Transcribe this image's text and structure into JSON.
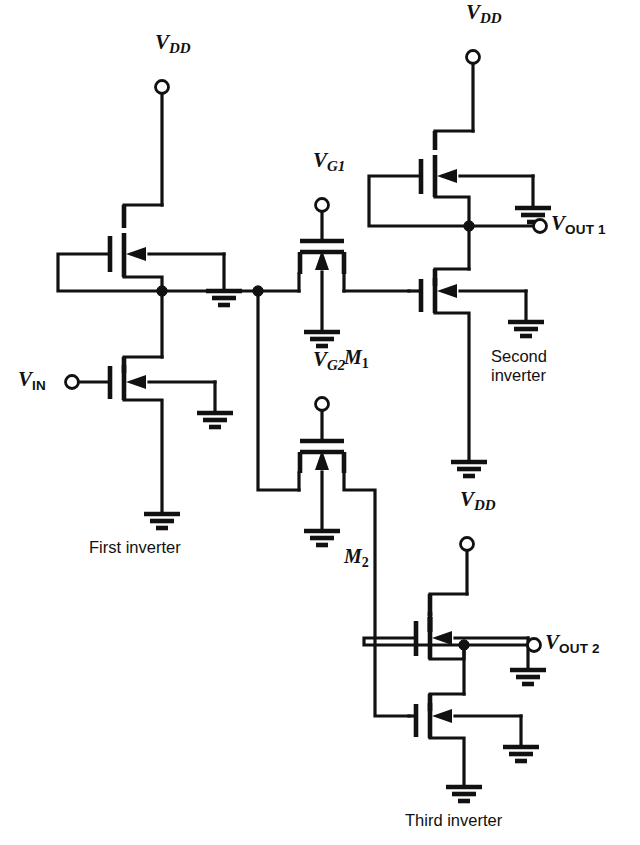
{
  "figure": {
    "type": "circuit-schematic",
    "line_color": "#111111",
    "background_color": "#ffffff"
  },
  "labels": {
    "vdd_first": {
      "base": "V",
      "sub": "DD"
    },
    "vdd_second": {
      "base": "V",
      "sub": "DD"
    },
    "vdd_third": {
      "base": "V",
      "sub": "DD"
    },
    "vin": {
      "base": "V",
      "sub": "IN"
    },
    "vout1": {
      "base": "V",
      "sub": "OUT 1"
    },
    "vout2": {
      "base": "V",
      "sub": "OUT 2"
    },
    "vg1": {
      "base": "V",
      "sub": "G1"
    },
    "vg2": {
      "base": "V",
      "sub": "G2"
    },
    "m1": {
      "base": "M",
      "sub": "1"
    },
    "m2": {
      "base": "M",
      "sub": "2"
    }
  },
  "captions": {
    "first_inverter": "First inverter",
    "second_inverter_line1": "Second",
    "second_inverter_line2": "inverter",
    "third_inverter": "Third inverter"
  },
  "components": [
    {
      "name": "first-inverter-load-transistor",
      "kind": "depletion-nmos-load"
    },
    {
      "name": "first-inverter-driver-transistor",
      "kind": "enhancement-nmos-driver"
    },
    {
      "name": "pass-transistor-m1",
      "kind": "nmos-pass-gate"
    },
    {
      "name": "pass-transistor-m2",
      "kind": "nmos-pass-gate"
    },
    {
      "name": "second-inverter-load-transistor",
      "kind": "depletion-nmos-load"
    },
    {
      "name": "second-inverter-driver-transistor",
      "kind": "enhancement-nmos-driver"
    },
    {
      "name": "third-inverter-load-transistor",
      "kind": "depletion-nmos-load"
    },
    {
      "name": "third-inverter-driver-transistor",
      "kind": "enhancement-nmos-driver"
    }
  ],
  "terminals": [
    {
      "name": "vdd-first-terminal",
      "x": 162,
      "y": 87
    },
    {
      "name": "vin-terminal",
      "x": 72,
      "y": 382
    },
    {
      "name": "vg1-terminal",
      "x": 322,
      "y": 205
    },
    {
      "name": "vg2-terminal",
      "x": 322,
      "y": 404
    },
    {
      "name": "vdd-second-terminal",
      "x": 473,
      "y": 57
    },
    {
      "name": "vout1-terminal",
      "x": 540,
      "y": 226
    },
    {
      "name": "vdd-third-terminal",
      "x": 467,
      "y": 544
    },
    {
      "name": "vout2-terminal",
      "x": 534,
      "y": 645
    }
  ],
  "junction_nodes": [
    {
      "name": "first-inverter-output-node",
      "x": 162,
      "y": 291
    },
    {
      "name": "pass-gate-branch-node",
      "x": 258,
      "y": 291
    },
    {
      "name": "second-inverter-output-node",
      "x": 469,
      "y": 226
    },
    {
      "name": "third-inverter-output-node",
      "x": 464,
      "y": 645
    }
  ]
}
